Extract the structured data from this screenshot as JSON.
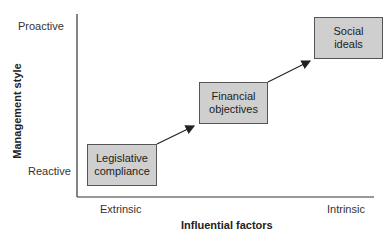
{
  "diagram": {
    "y_axis": {
      "title": "Management style",
      "ticks": [
        "Proactive",
        "Reactive"
      ]
    },
    "x_axis": {
      "title": "Influential factors",
      "ticks": [
        "Extrinsic",
        "Intrinsic"
      ]
    },
    "boxes": [
      {
        "label": "Legislative\ncompliance"
      },
      {
        "label": "Financial\nobjectives"
      },
      {
        "label": "Social\nideals"
      }
    ],
    "colors": {
      "box_fill": "#cfcfcf",
      "box_border": "#555555",
      "axis": "#333333"
    }
  }
}
